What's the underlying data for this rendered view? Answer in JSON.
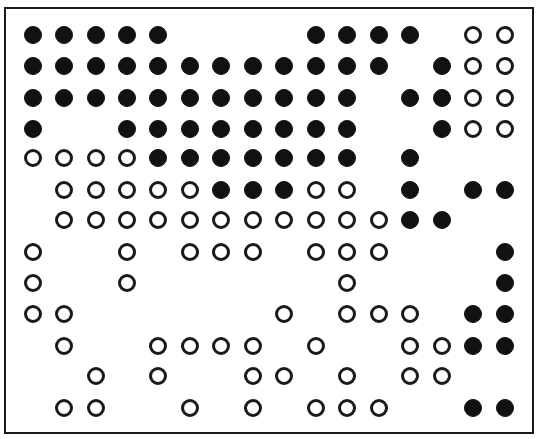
{
  "diagram": {
    "type": "dot-grid",
    "columns": 16,
    "rows": 13,
    "legend": {
      "F": "filled-circle",
      "O": "open-circle",
      ".": "empty"
    },
    "colors": {
      "filled": "#111111",
      "outline": "#1a1a1a",
      "background": "#ffffff",
      "border": "#1a1a1a"
    },
    "col_x": [
      33,
      64,
      96,
      127,
      158,
      190,
      221,
      253,
      284,
      316,
      347,
      379,
      410,
      442,
      473,
      505
    ],
    "row_y": [
      35,
      66,
      98,
      129,
      158,
      190,
      220,
      252,
      283,
      314,
      346,
      376,
      408
    ],
    "grid": [
      "FFFFF....FFFF.OO",
      "FFFFFFFFFFFF.FOO",
      "FFFFFFFFFFF.FFOO",
      "F..FFFFFFFF..FOO",
      "OOOOFFFFFFF.F...",
      ".OOOOOFFFOO.F.FF",
      ".OOOOOOOOOOOFF..",
      "O..O.OOO.OOO...F",
      "O..O......O....F",
      "OO......O.OOO.FF",
      ".O..OOOO.O..OOFF",
      "..O.O..OO.O.OO..",
      ".OO..O.O.OOO..FF"
    ]
  }
}
